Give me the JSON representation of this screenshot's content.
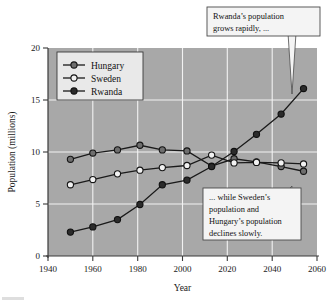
{
  "chart_data": {
    "type": "line",
    "title": "",
    "xlabel": "Year",
    "ylabel": "Population (millions)",
    "xlim": [
      1940,
      2060
    ],
    "ylim": [
      0,
      20
    ],
    "xticks": [
      1940,
      1960,
      1980,
      2000,
      2020,
      2040,
      2060
    ],
    "xtick_labels": [
      "1940",
      "1960",
      "1980",
      "2000",
      "2020",
      "2040",
      "2060"
    ],
    "yticks": [
      0,
      5,
      10,
      15,
      20
    ],
    "ytick_labels": [
      "0",
      "5",
      "10",
      "15",
      "20"
    ],
    "grid": true,
    "legend_position": "upper-left",
    "series": [
      {
        "name": "Hungary",
        "marker": "filled-gray-circle",
        "color": "#6e6e6e",
        "x": [
          1950,
          1960,
          1971,
          1981,
          1991,
          2002,
          2013,
          2023,
          2033,
          2044,
          2054
        ],
        "values": [
          9.3,
          9.9,
          10.2,
          10.65,
          10.2,
          10.1,
          8.65,
          9.35,
          9.05,
          8.6,
          8.15
        ]
      },
      {
        "name": "Sweden",
        "marker": "open-circle",
        "color": "#f2f2f2",
        "x": [
          1950,
          1960,
          1971,
          1981,
          1991,
          2002,
          2013,
          2023,
          2033,
          2044,
          2054
        ],
        "values": [
          6.85,
          7.35,
          7.9,
          8.25,
          8.5,
          8.7,
          9.7,
          8.95,
          9.0,
          8.95,
          8.85
        ]
      },
      {
        "name": "Rwanda",
        "marker": "filled-dark-circle",
        "color": "#2b2b2b",
        "x": [
          1950,
          1960,
          1971,
          1981,
          1991,
          2002,
          2013,
          2023,
          2033,
          2044,
          2054
        ],
        "values": [
          2.3,
          2.8,
          3.5,
          4.95,
          6.85,
          7.3,
          8.6,
          10.05,
          11.7,
          13.65,
          16.1
        ]
      }
    ],
    "annotations": [
      {
        "id": "callout-rwanda",
        "lines": [
          "Rwanda’s population",
          "grows rapidly, ..."
        ],
        "points_to_series": "Rwanda",
        "points_to_x": 2054,
        "points_to_y": 16.1
      },
      {
        "id": "callout-sweden-hungary",
        "lines": [
          "... while Sweden’s",
          "population and",
          "Hungary’s population",
          "declines slowly."
        ],
        "points_to_series": "Hungary",
        "points_to_x": 2054,
        "points_to_y": 8.15
      }
    ],
    "legend": [
      {
        "label": "Hungary"
      },
      {
        "label": "Sweden"
      },
      {
        "label": "Rwanda"
      }
    ]
  }
}
